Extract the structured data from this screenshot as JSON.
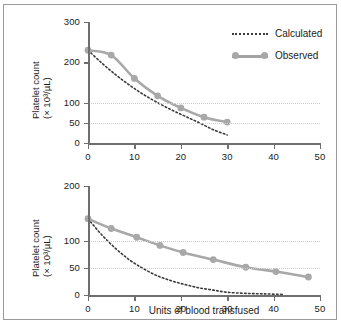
{
  "figure": {
    "axis_color": "#6e6e6e",
    "observed_color": "#a8a8a8",
    "calculated_color": "#3a3a3a",
    "gridline_color": "#d8c9c9",
    "border_color": "#9a9a9a",
    "xlabel": "Units of blood transfused",
    "ylabel_line1": "Platelet count",
    "ylabel_line2": "(× 10³/µL)"
  },
  "legend": {
    "calculated": "Calculated",
    "observed": "Observed"
  },
  "chart_data": [
    {
      "type": "line",
      "title": "",
      "panel": "top",
      "xlabel": "",
      "ylabel": "Platelet count (× 10³/µL)",
      "xlim": [
        0,
        50
      ],
      "ylim": [
        0,
        300
      ],
      "xticks": [
        0,
        10,
        20,
        30,
        40,
        50
      ],
      "xticklabels": [
        "0",
        "10",
        "20",
        "30",
        "40",
        "50"
      ],
      "yticks": [
        0,
        50,
        100,
        200,
        300
      ],
      "yticklabels": [
        "0",
        "50",
        "100",
        "200",
        "300"
      ],
      "gridlines_y": [
        50,
        100
      ],
      "grid": "horizontal-dotted",
      "legend_position": "upper-right",
      "series": [
        {
          "name": "Observed",
          "style": "solid-with-markers",
          "x": [
            0,
            5,
            10,
            15,
            20,
            25,
            30
          ],
          "values": [
            230,
            218,
            160,
            117,
            87,
            64,
            52
          ]
        },
        {
          "name": "Calculated",
          "style": "dotted",
          "x": [
            0,
            3,
            6,
            9,
            12,
            15,
            18,
            21,
            24,
            27,
            30
          ],
          "values": [
            230,
            198,
            169,
            143,
            120,
            100,
            82,
            66,
            50,
            33,
            20
          ]
        }
      ]
    },
    {
      "type": "line",
      "title": "",
      "panel": "bottom",
      "xlabel": "Units of blood transfused",
      "ylabel": "Platelet count (× 10³/µL)",
      "xlim": [
        0,
        50
      ],
      "ylim": [
        0,
        200
      ],
      "xticks": [
        0,
        10,
        20,
        30,
        40,
        50
      ],
      "xticklabels": [
        "0",
        "10",
        "20",
        "30",
        "40",
        "50"
      ],
      "yticks": [
        0,
        50,
        100,
        200
      ],
      "yticklabels": [
        "0",
        "50",
        "100",
        "200"
      ],
      "gridlines_y": [
        50,
        100
      ],
      "grid": "horizontal-dotted",
      "legend_position": "none",
      "series": [
        {
          "name": "Observed",
          "style": "solid-with-markers",
          "x": [
            0,
            5,
            10.5,
            15.5,
            20.5,
            27,
            34,
            40.5,
            47.5
          ],
          "values": [
            140,
            122,
            106,
            91,
            78,
            65,
            51,
            43,
            33
          ]
        },
        {
          "name": "Calculated",
          "style": "dotted",
          "x": [
            0,
            3,
            6,
            9,
            12,
            15,
            18,
            21,
            24,
            27,
            30,
            34,
            38,
            42
          ],
          "values": [
            140,
            110,
            85,
            64,
            48,
            35,
            26,
            19,
            13,
            9,
            5,
            3,
            2,
            1
          ]
        }
      ]
    }
  ]
}
